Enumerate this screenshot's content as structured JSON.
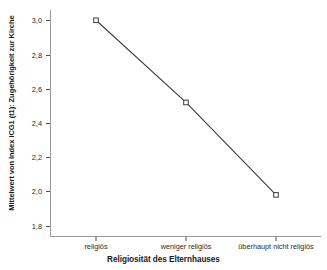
{
  "chart_data": {
    "type": "line",
    "title": "",
    "subtitle": "",
    "xlabel": "Religiosität des Elternhauses",
    "ylabel": "Mittelwert von Index iCG1 (t1): Zugehörigkeit zur Kirche",
    "categories": [
      "religiös",
      "weniger religiös",
      "überhaupt nicht religiös"
    ],
    "values": [
      3.0,
      2.52,
      1.98
    ],
    "series": [
      {
        "name": "Mittelwert von Index iCG1 (t1): Zugehörigkeit zur Kirche",
        "values": [
          3.0,
          2.52,
          1.98
        ]
      }
    ],
    "ylim": [
      1.74,
      3.06
    ],
    "yticks": [
      3.0,
      2.8,
      2.6,
      2.4,
      2.2,
      2.0,
      1.8
    ],
    "ytick_labels": [
      "3,0",
      "2,8",
      "2,6",
      "2,4",
      "2,2",
      "2,0",
      "1,8"
    ],
    "grid": false,
    "legend": false,
    "legend_position": "none",
    "marker": "open-square",
    "line_color": "#3c3c3c",
    "marker_edge_color": "#3c3c3c",
    "marker_face_color": "#ffffff",
    "axis_color": "#9a9a9a",
    "background_color": "#ffffff"
  }
}
